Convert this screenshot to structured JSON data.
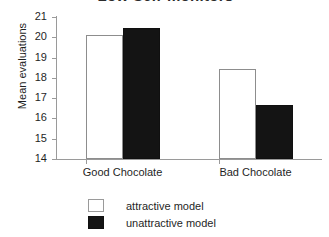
{
  "chart_data": {
    "type": "bar",
    "title": "Low Self-monitors",
    "xlabel": "",
    "ylabel": "Mean evaluations",
    "categories": [
      "Good Chocolate",
      "Bad Chocolate"
    ],
    "series": [
      {
        "name": "attractive model",
        "values": [
          20.1,
          18.45
        ],
        "color": "#ffffff"
      },
      {
        "name": "unattractive model",
        "values": [
          20.45,
          16.65
        ],
        "color": "#141414"
      }
    ],
    "ylim": [
      14,
      21
    ],
    "yticks": [
      21,
      20,
      19,
      18,
      17,
      16,
      15,
      14
    ],
    "ytick_labels": [
      "21",
      "20",
      "19",
      "18",
      "17",
      "16",
      "15",
      "14"
    ],
    "grid": false,
    "legend_position": "bottom-center"
  },
  "legend": {
    "items": [
      {
        "label": "attractive model",
        "swatch": "white-square-icon"
      },
      {
        "label": "unattractive model",
        "swatch": "black-square-icon"
      }
    ]
  }
}
